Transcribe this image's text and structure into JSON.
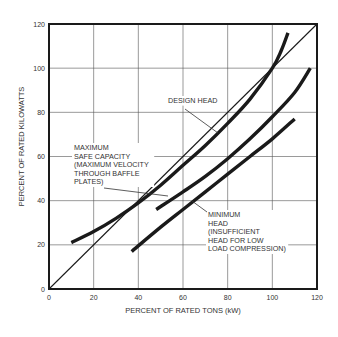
{
  "chart_data": {
    "type": "line",
    "title": "",
    "xlabel": "PERCENT OF RATED TONS (kW)",
    "ylabel": "PERCENT OF RATED KILOWATTS",
    "xlim": [
      0,
      120
    ],
    "ylim": [
      0,
      120
    ],
    "xticks": [
      0,
      20,
      40,
      60,
      80,
      100,
      120
    ],
    "yticks": [
      0,
      20,
      40,
      60,
      80,
      100,
      120
    ],
    "grid": true,
    "series": [
      {
        "name": "Reference (1:1)",
        "style": "thin",
        "points": [
          [
            0,
            0
          ],
          [
            120,
            120
          ]
        ]
      },
      {
        "name": "Design Head",
        "style": "thick",
        "points": [
          [
            10,
            21
          ],
          [
            20,
            26
          ],
          [
            30,
            32
          ],
          [
            40,
            39
          ],
          [
            50,
            47
          ],
          [
            60,
            56
          ],
          [
            70,
            65
          ],
          [
            80,
            75
          ],
          [
            90,
            86
          ],
          [
            100,
            100
          ],
          [
            104,
            108
          ],
          [
            107,
            116
          ]
        ]
      },
      {
        "name": "Maximum Safe Capacity",
        "style": "thick",
        "points": [
          [
            48,
            36
          ],
          [
            60,
            44
          ],
          [
            70,
            51
          ],
          [
            80,
            59
          ],
          [
            90,
            68
          ],
          [
            100,
            78
          ],
          [
            110,
            89
          ],
          [
            117,
            100
          ]
        ]
      },
      {
        "name": "Minimum Head",
        "style": "thick",
        "points": [
          [
            37,
            17
          ],
          [
            50,
            28
          ],
          [
            60,
            36
          ],
          [
            70,
            44
          ],
          [
            80,
            52
          ],
          [
            90,
            60
          ],
          [
            100,
            68
          ],
          [
            110,
            77
          ]
        ]
      }
    ],
    "annotations": [
      {
        "id": "design",
        "lines": [
          "DESIGN HEAD"
        ],
        "x": 168,
        "y": 103,
        "leader": [
          [
            185,
            109
          ],
          [
            218,
            133
          ]
        ]
      },
      {
        "id": "maxsafe",
        "lines": [
          "MAXIMUM",
          "SAFE CAPACITY",
          "(MAXIMUM VELOCITY",
          "THROUGH BAFFLE",
          "PLATES)"
        ],
        "x": 74,
        "y": 150,
        "leader": [
          [
            104,
            188
          ],
          [
            168,
            196
          ]
        ]
      },
      {
        "id": "minhead",
        "lines": [
          "MINIMUM",
          "HEAD",
          "(INSUFFICIENT",
          "HEAD FOR LOW",
          "LOAD COMPRESSION)"
        ],
        "x": 208,
        "y": 217,
        "leader": [
          [
            207,
            212
          ],
          [
            192,
            201
          ]
        ]
      }
    ]
  },
  "colors": {
    "line": "#1a1a1a",
    "grid": "#555555",
    "text": "#333333"
  }
}
